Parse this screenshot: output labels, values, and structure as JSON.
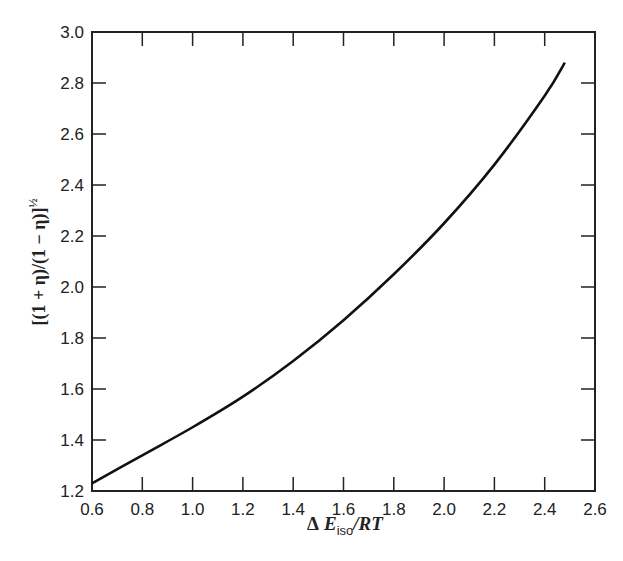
{
  "chart_data": {
    "type": "line",
    "title": "",
    "xlabel": "ΔE_iso/RT",
    "ylabel": "[(1 + η)/(1 − η)]^½",
    "xlim": [
      0.6,
      2.6
    ],
    "ylim": [
      1.2,
      3.0
    ],
    "xticks": [
      "0.6",
      "0.8",
      "1.0",
      "1.2",
      "1.4",
      "1.6",
      "1.8",
      "2.0",
      "2.2",
      "2.4",
      "2.6"
    ],
    "yticks": [
      "1.2",
      "1.4",
      "1.6",
      "1.8",
      "2.0",
      "2.2",
      "2.4",
      "2.6",
      "2.8",
      "3.0"
    ],
    "grid": false,
    "legend": null,
    "series": [
      {
        "name": "curve",
        "x": [
          0.6,
          0.8,
          1.0,
          1.2,
          1.4,
          1.6,
          1.8,
          2.0,
          2.2,
          2.4,
          2.48
        ],
        "y": [
          1.23,
          1.34,
          1.45,
          1.57,
          1.71,
          1.87,
          2.05,
          2.25,
          2.48,
          2.75,
          2.88
        ]
      }
    ]
  },
  "labels": {
    "x_delta": "Δ",
    "x_E": "E",
    "x_sub": "iso",
    "x_rest": "/RT",
    "y_main": "[(1 + η)/(1 − η)]",
    "y_sup": "½"
  }
}
